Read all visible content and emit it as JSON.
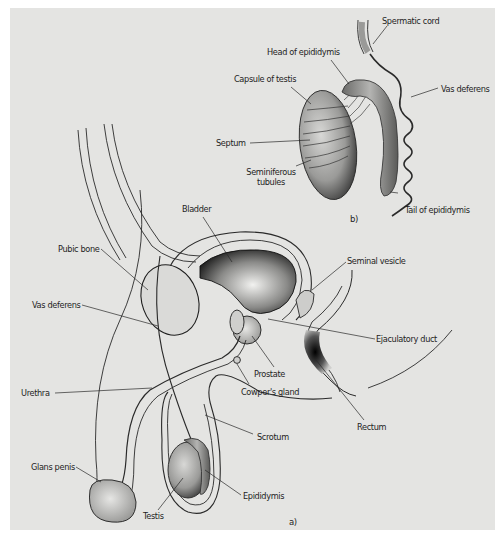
{
  "figure": {
    "background_color": "#e4e4e2",
    "ink_color": "#1e1e1e",
    "panel_b": {
      "tag": "b)",
      "labels": {
        "spermatic_cord": "Spermatic cord",
        "head_of_epididymis": "Head of epididymis",
        "capsule_of_testis": "Capsule of testis",
        "vas_deferens": "Vas deferens",
        "septum": "Septum",
        "seminiferous_tubules_1": "Seminiferous",
        "seminiferous_tubules_2": "tubules",
        "tail_of_epididymis": "Tail of epididymis"
      }
    },
    "panel_a": {
      "tag": "a)",
      "labels": {
        "bladder": "Bladder",
        "pubic_bone": "Pubic bone",
        "seminal_vesicle": "Seminal vesicle",
        "vas_deferens": "Vas deferens",
        "ejaculatory_duct": "Ejaculatory duct",
        "prostate": "Prostate",
        "cowpers_gland": "Cowper's gland",
        "urethra": "Urethra",
        "scrotum": "Scrotum",
        "rectum": "Rectum",
        "glans_penis": "Glans penis",
        "epididymis": "Epididymis",
        "testis": "Testis"
      }
    }
  }
}
